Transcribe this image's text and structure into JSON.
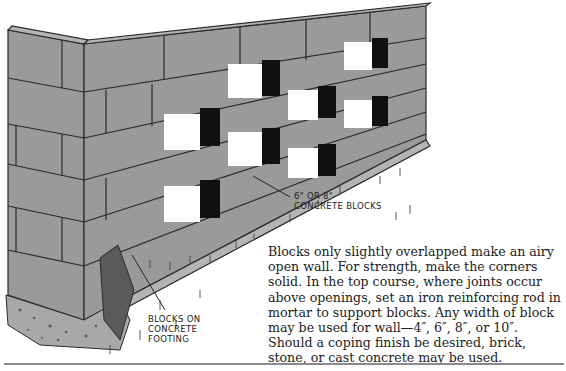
{
  "figure": {
    "labels": {
      "blocks": [
        "6\" OR 8\"",
        "CONCRETE BLOCKS"
      ],
      "footing": [
        "BLOCKS ON",
        "CONCRETE",
        "FOOTING"
      ]
    },
    "colors": {
      "block_face": "#9a9a9a",
      "block_top": "#b4b4b4",
      "opening_shadow": "#101010",
      "opening_light": "#ffffff",
      "mortar": "#2a2a2a",
      "footing": "#a8a8a8"
    }
  },
  "caption": {
    "text": "Blocks only slightly overlapped make an airy open wall. For strength, make the corners solid. In the top course, where joints occur above openings, set an iron reinforcing rod in mortar to support blocks. Any width of block may be used for wall—4″, 6″, 8″, or 10″. Should a coping finish be desired, brick, stone, or cast concrete may be used."
  }
}
